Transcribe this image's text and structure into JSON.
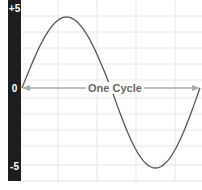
{
  "chart_data": {
    "type": "line",
    "title": "",
    "xlabel": "",
    "ylabel": "",
    "ylim": [
      -5,
      5
    ],
    "yticks": [
      "+5",
      "0",
      "-5"
    ],
    "grid": true,
    "legend": null,
    "series": [
      {
        "name": "sine wave",
        "x": [
          0,
          0.125,
          0.25,
          0.375,
          0.5,
          0.625,
          0.75,
          0.875,
          1.0
        ],
        "values": [
          0,
          3.54,
          5,
          3.54,
          0,
          -3.54,
          -5,
          -3.54,
          0
        ]
      }
    ],
    "annotations": [
      {
        "text": "One Cycle",
        "type": "double-arrow",
        "from_x": 0,
        "to_x": 1,
        "y": 0
      }
    ],
    "colors": {
      "axis_bar": "#1e1e1e",
      "curve": "#555555",
      "grid": "#e6e6e6",
      "arrow": "#aaaaaa",
      "annotation_text": "#666666"
    }
  },
  "labels": {
    "y_top": "+5",
    "y_mid": "0",
    "y_bottom": "-5",
    "annotation": "One Cycle"
  }
}
